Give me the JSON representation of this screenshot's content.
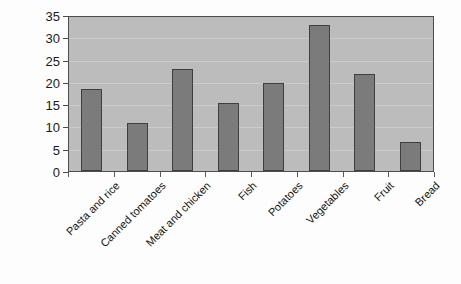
{
  "chart_data": {
    "type": "bar",
    "title": "",
    "subtitle": "",
    "xlabel": "",
    "ylabel": "",
    "categories": [
      "Pasta and rice",
      "Canned tomatoes",
      "Meat and chicken",
      "Fish",
      "Potatoes",
      "Vegetables",
      "Fruit",
      "Bread"
    ],
    "values": [
      18.5,
      10.8,
      23.0,
      15.2,
      19.8,
      32.7,
      21.8,
      6.5
    ],
    "ylim": [
      0,
      35
    ],
    "yticks": [
      0,
      5,
      10,
      15,
      20,
      25,
      30,
      35
    ],
    "ytick_labels": [
      "0",
      "5",
      "10",
      "15",
      "20",
      "25",
      "30",
      "35"
    ],
    "grid": true,
    "grid_axis": "y",
    "legend": false,
    "legend_position": "none",
    "series": [
      {
        "name": "",
        "values": [
          18.5,
          10.8,
          23.0,
          15.2,
          19.8,
          32.7,
          21.8,
          6.5
        ]
      }
    ],
    "colors": {
      "bar_fill": "#7b7b7b",
      "bar_border": "#3f3f3f",
      "plot_background": "#bcbcbc",
      "gridline": "#cbcbcb",
      "axis": "#4d4d4d",
      "text": "#111111",
      "page_background": "#ffffff"
    }
  }
}
